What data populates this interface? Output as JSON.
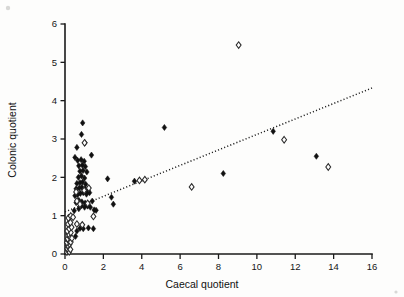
{
  "figure": {
    "background": "#fdfdfc",
    "ink_color": "#161616"
  },
  "chart_data": {
    "type": "scatter",
    "title": "",
    "xlabel": "Caecal quotient",
    "ylabel": "Colonic quotient",
    "xlim": [
      0,
      16
    ],
    "ylim": [
      0,
      6
    ],
    "xticks": [
      0,
      2,
      4,
      6,
      8,
      10,
      12,
      14,
      16
    ],
    "yticks": [
      0,
      1,
      2,
      3,
      4,
      5,
      6
    ],
    "xtick_labels": [
      "0",
      "2",
      "4",
      "6",
      "8",
      "10",
      "12",
      "14",
      "16"
    ],
    "ytick_labels": [
      "0",
      "1",
      "2",
      "3",
      "4",
      "5",
      "6"
    ],
    "grid": false,
    "legend": false,
    "legend_position": "none",
    "series": [
      {
        "name": "filled-diamond",
        "marker": "filled diamond",
        "color": "#111111",
        "points": [
          [
            0.55,
            0.46
          ],
          [
            0.62,
            0.6
          ],
          [
            0.78,
            0.67
          ],
          [
            0.95,
            0.66
          ],
          [
            1.22,
            0.68
          ],
          [
            1.48,
            0.66
          ],
          [
            0.48,
            1.13
          ],
          [
            0.72,
            1.18
          ],
          [
            0.86,
            1.26
          ],
          [
            1.02,
            1.22
          ],
          [
            1.18,
            1.25
          ],
          [
            1.32,
            1.22
          ],
          [
            1.52,
            1.15
          ],
          [
            0.58,
            1.34
          ],
          [
            0.72,
            1.4
          ],
          [
            0.88,
            1.36
          ],
          [
            1.05,
            1.33
          ],
          [
            1.42,
            1.38
          ],
          [
            1.62,
            1.14
          ],
          [
            0.52,
            1.52
          ],
          [
            0.66,
            1.55
          ],
          [
            0.8,
            1.58
          ],
          [
            0.95,
            1.6
          ],
          [
            1.12,
            1.56
          ],
          [
            1.28,
            1.6
          ],
          [
            0.58,
            1.7
          ],
          [
            0.74,
            1.72
          ],
          [
            0.88,
            1.74
          ],
          [
            1.04,
            1.7
          ],
          [
            1.2,
            1.65
          ],
          [
            0.62,
            1.84
          ],
          [
            0.78,
            1.86
          ],
          [
            0.92,
            1.88
          ],
          [
            1.08,
            1.82
          ],
          [
            0.7,
            2.0
          ],
          [
            0.86,
            2.04
          ],
          [
            1.02,
            1.98
          ],
          [
            0.78,
            2.16
          ],
          [
            0.94,
            2.18
          ],
          [
            1.14,
            2.14
          ],
          [
            0.72,
            2.3
          ],
          [
            0.9,
            2.32
          ],
          [
            1.06,
            2.28
          ],
          [
            0.66,
            2.44
          ],
          [
            0.84,
            2.46
          ],
          [
            1.0,
            2.42
          ],
          [
            0.52,
            2.52
          ],
          [
            1.38,
            2.58
          ],
          [
            0.62,
            2.78
          ],
          [
            1.04,
            2.9
          ],
          [
            0.86,
            3.12
          ],
          [
            0.92,
            3.42
          ],
          [
            2.22,
            1.96
          ],
          [
            2.42,
            1.48
          ],
          [
            2.52,
            1.3
          ],
          [
            3.62,
            1.9
          ],
          [
            5.18,
            3.3
          ],
          [
            8.25,
            2.1
          ],
          [
            10.85,
            3.2
          ],
          [
            13.1,
            2.55
          ]
        ]
      },
      {
        "name": "open-diamond",
        "marker": "open diamond",
        "color": "#ffffff",
        "points": [
          [
            0.1,
            0.05
          ],
          [
            0.16,
            0.09
          ],
          [
            0.22,
            0.06
          ],
          [
            0.12,
            0.14
          ],
          [
            0.2,
            0.17
          ],
          [
            0.28,
            0.12
          ],
          [
            0.15,
            0.22
          ],
          [
            0.24,
            0.26
          ],
          [
            0.1,
            0.3
          ],
          [
            0.2,
            0.34
          ],
          [
            0.3,
            0.31
          ],
          [
            0.14,
            0.4
          ],
          [
            0.25,
            0.44
          ],
          [
            0.36,
            0.41
          ],
          [
            0.18,
            0.52
          ],
          [
            0.3,
            0.56
          ],
          [
            0.12,
            0.6
          ],
          [
            0.22,
            0.66
          ],
          [
            0.34,
            0.7
          ],
          [
            0.16,
            0.78
          ],
          [
            0.28,
            0.82
          ],
          [
            0.18,
            0.94
          ],
          [
            0.3,
            0.99
          ],
          [
            0.42,
            0.96
          ],
          [
            0.62,
            0.78
          ],
          [
            0.9,
            0.76
          ],
          [
            1.48,
            0.98
          ],
          [
            0.62,
            1.38
          ],
          [
            0.78,
            1.3
          ],
          [
            1.18,
            1.32
          ],
          [
            0.58,
            1.62
          ],
          [
            1.0,
            1.66
          ],
          [
            1.24,
            1.72
          ],
          [
            1.02,
            2.9
          ],
          [
            3.88,
            1.92
          ],
          [
            4.16,
            1.94
          ],
          [
            6.6,
            1.75
          ],
          [
            9.05,
            5.45
          ],
          [
            11.42,
            2.98
          ],
          [
            13.72,
            2.27
          ]
        ]
      }
    ],
    "trend_line": {
      "name": "regression-line",
      "style": "dotted",
      "x_start": 0.0,
      "y_start": 1.1,
      "x_end": 16.0,
      "y_end": 4.33
    }
  }
}
